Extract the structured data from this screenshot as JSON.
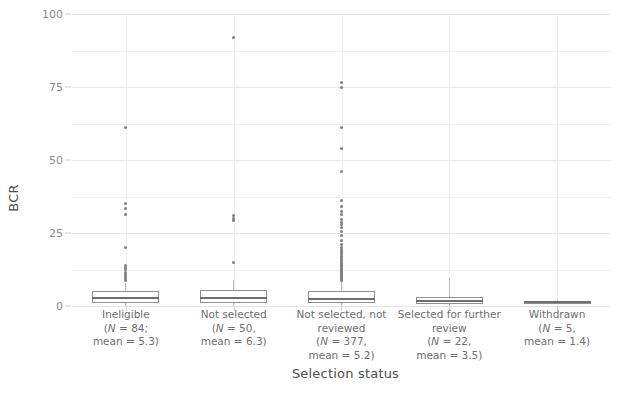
{
  "chart_data": {
    "type": "box",
    "title": "",
    "xlabel": "Selection status",
    "ylabel": "BCR",
    "ylim": [
      0,
      100
    ],
    "yticks": [
      0,
      25,
      50,
      75,
      100
    ],
    "ytick_labels": [
      "0",
      "25",
      "50",
      "75",
      "100"
    ],
    "grid": true,
    "legend": "none",
    "categories": [
      "Ineligible",
      "Not selected",
      "Not selected, not reviewed",
      "Selected for further review",
      "Withdrawn"
    ],
    "groups": [
      {
        "category": "Ineligible",
        "label_lines": [
          "Ineligible",
          "(N = 84;",
          "mean = 5.3)"
        ],
        "n": 84,
        "mean": 5.3,
        "whisker_low": 0.0,
        "q1": 1.0,
        "median": 2.6,
        "q3": 5.2,
        "whisker_high": 8.0,
        "outliers": [
          61.0,
          35.0,
          33.5,
          31.5,
          20.0,
          14.0,
          13.2,
          12.4,
          11.6,
          10.8,
          10.0,
          9.4,
          8.8
        ]
      },
      {
        "category": "Not selected",
        "label_lines": [
          "Not selected",
          "(N = 50,",
          "mean = 6.3)"
        ],
        "n": 50,
        "mean": 6.3,
        "whisker_low": 0.0,
        "q1": 1.1,
        "median": 2.9,
        "q3": 5.6,
        "whisker_high": 9.0,
        "outliers": [
          92.0,
          31.0,
          30.0,
          29.4,
          15.0
        ]
      },
      {
        "category": "Not selected, not reviewed",
        "label_lines": [
          "Not selected, not",
          "reviewed",
          "(N = 377,",
          "mean = 5.2)"
        ],
        "n": 377,
        "mean": 5.2,
        "whisker_low": 0.0,
        "q1": 1.0,
        "median": 2.5,
        "q3": 5.0,
        "whisker_high": 8.5,
        "outliers": [
          76.5,
          75.0,
          61.0,
          54.0,
          46.0,
          36.0,
          34.0,
          32.5,
          31.5,
          29.5,
          28.5,
          27.8,
          27.0,
          25.5,
          24.0,
          22.5,
          21.0,
          20.0,
          19.4,
          18.8,
          18.2,
          17.6,
          17.0,
          16.5,
          16.0,
          15.5,
          15.0,
          14.6,
          14.2,
          13.8,
          13.4,
          13.0,
          12.6,
          12.2,
          11.8,
          11.4,
          11.0,
          10.7,
          10.4,
          10.1,
          9.8,
          9.5,
          9.2,
          8.9
        ]
      },
      {
        "category": "Selected for further review",
        "label_lines": [
          "Selected for further",
          "review",
          "(N = 22,",
          "mean = 3.5)"
        ],
        "n": 22,
        "mean": 3.5,
        "whisker_low": 0.0,
        "q1": 0.8,
        "median": 1.6,
        "q3": 3.0,
        "whisker_high": 9.5,
        "outliers": []
      },
      {
        "category": "Withdrawn",
        "label_lines": [
          "Withdrawn",
          "(N = 5,",
          "mean = 1.4)"
        ],
        "n": 5,
        "mean": 1.4,
        "whisker_low": 0.7,
        "q1": 0.9,
        "median": 1.3,
        "q3": 1.7,
        "whisker_high": 2.0,
        "outliers": []
      }
    ],
    "colors": {
      "background": "#ffffff",
      "gridline": "#e8e8e8",
      "box_border": "#8f8f8f",
      "median": "#6e6e6e",
      "outlier": "#808080",
      "axis_text": "#6e6e6e",
      "tick_text": "#8c8c8c"
    }
  }
}
